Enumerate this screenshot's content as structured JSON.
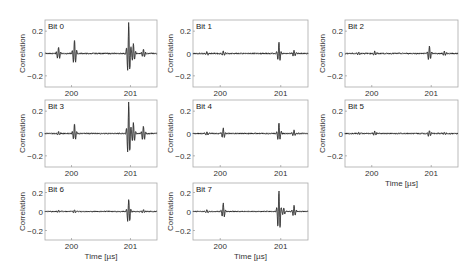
{
  "chart_data": [
    {
      "type": "line",
      "title": "Bit 0",
      "xlabel": "",
      "ylabel": "Correlation",
      "xlim": [
        199.55,
        201.45
      ],
      "ylim": [
        -0.3,
        0.3
      ],
      "xticks": [
        200,
        201
      ],
      "yticks": [
        -0.2,
        0,
        0.2
      ],
      "ytick_labels": [
        "−0.2",
        "0",
        "0.2"
      ],
      "series": [
        {
          "name": "signal",
          "bursts": [
            {
              "t": 199.78,
              "amp": 0.06
            },
            {
              "t": 200.05,
              "amp": 0.13,
              "neg": -0.12
            },
            {
              "t": 200.97,
              "amp": 0.28,
              "neg": -0.23
            },
            {
              "t": 201.05,
              "amp": 0.09
            },
            {
              "t": 201.22,
              "amp": 0.04
            }
          ]
        }
      ]
    },
    {
      "type": "line",
      "title": "Bit 1",
      "xlabel": "",
      "ylabel": "Correlation",
      "xlim": [
        199.55,
        201.45
      ],
      "ylim": [
        -0.3,
        0.3
      ],
      "xticks": [
        200,
        201
      ],
      "yticks": [
        -0.2,
        0,
        0.2
      ],
      "ytick_labels": [
        "−0.2",
        "0",
        "0.2"
      ],
      "series": [
        {
          "name": "signal",
          "bursts": [
            {
              "t": 199.78,
              "amp": 0.015
            },
            {
              "t": 200.05,
              "amp": 0.02
            },
            {
              "t": 200.97,
              "amp": 0.1,
              "neg": -0.09
            },
            {
              "t": 201.22,
              "amp": 0.03
            }
          ]
        }
      ]
    },
    {
      "type": "line",
      "title": "Bit 2",
      "xlabel": "",
      "ylabel": "Correlation",
      "xlim": [
        199.55,
        201.45
      ],
      "ylim": [
        -0.3,
        0.3
      ],
      "xticks": [
        200,
        201
      ],
      "yticks": [
        -0.2,
        0,
        0.2
      ],
      "ytick_labels": [
        "−0.2",
        "0",
        "0.2"
      ],
      "series": [
        {
          "name": "signal",
          "bursts": [
            {
              "t": 199.78,
              "amp": 0.015
            },
            {
              "t": 200.05,
              "amp": 0.02
            },
            {
              "t": 200.97,
              "amp": 0.07,
              "neg": -0.08
            },
            {
              "t": 201.22,
              "amp": 0.02
            }
          ]
        }
      ]
    },
    {
      "type": "line",
      "title": "Bit 3",
      "xlabel": "",
      "ylabel": "Correlation",
      "xlim": [
        199.55,
        201.45
      ],
      "ylim": [
        -0.3,
        0.3
      ],
      "xticks": [
        200,
        201
      ],
      "yticks": [
        -0.2,
        0,
        0.2
      ],
      "ytick_labels": [
        "−0.2",
        "0",
        "0.2"
      ],
      "series": [
        {
          "name": "signal",
          "bursts": [
            {
              "t": 199.78,
              "amp": 0.015
            },
            {
              "t": 200.05,
              "amp": 0.09,
              "neg": -0.08
            },
            {
              "t": 200.97,
              "amp": 0.28,
              "neg": -0.25
            },
            {
              "t": 201.05,
              "amp": 0.1
            },
            {
              "t": 201.22,
              "amp": 0.07,
              "neg": -0.08
            }
          ]
        }
      ]
    },
    {
      "type": "line",
      "title": "Bit 4",
      "xlabel": "",
      "ylabel": "Correlation",
      "xlim": [
        199.55,
        201.45
      ],
      "ylim": [
        -0.3,
        0.3
      ],
      "xticks": [
        200,
        201
      ],
      "yticks": [
        -0.2,
        0,
        0.2
      ],
      "ytick_labels": [
        "−0.2",
        "0",
        "0.2"
      ],
      "series": [
        {
          "name": "signal",
          "bursts": [
            {
              "t": 199.78,
              "amp": 0.015
            },
            {
              "t": 200.05,
              "amp": 0.05,
              "neg": -0.05
            },
            {
              "t": 200.97,
              "amp": 0.1,
              "neg": -0.08
            },
            {
              "t": 201.22,
              "amp": 0.03
            }
          ]
        }
      ]
    },
    {
      "type": "line",
      "title": "Bit 5",
      "xlabel": "Time [µs]",
      "ylabel": "Correlation",
      "xlim": [
        199.55,
        201.45
      ],
      "ylim": [
        -0.3,
        0.3
      ],
      "xticks": [
        200,
        201
      ],
      "yticks": [
        -0.2,
        0,
        0.2
      ],
      "ytick_labels": [
        "−0.2",
        "0",
        "0.2"
      ],
      "series": [
        {
          "name": "signal",
          "bursts": [
            {
              "t": 199.78,
              "amp": 0.01
            },
            {
              "t": 200.05,
              "amp": 0.02
            },
            {
              "t": 200.97,
              "amp": 0.03
            },
            {
              "t": 201.22,
              "amp": 0.01
            }
          ]
        }
      ]
    },
    {
      "type": "line",
      "title": "Bit 6",
      "xlabel": "Time [µs]",
      "ylabel": "Correlation",
      "xlim": [
        199.55,
        201.45
      ],
      "ylim": [
        -0.3,
        0.3
      ],
      "xticks": [
        200,
        201
      ],
      "yticks": [
        -0.2,
        0,
        0.2
      ],
      "ytick_labels": [
        "−0.2",
        "0",
        "0.2"
      ],
      "series": [
        {
          "name": "signal",
          "bursts": [
            {
              "t": 199.78,
              "amp": 0.01
            },
            {
              "t": 200.05,
              "amp": 0.02
            },
            {
              "t": 200.97,
              "amp": 0.13,
              "neg": -0.16
            },
            {
              "t": 201.22,
              "amp": 0.02
            }
          ]
        }
      ]
    },
    {
      "type": "line",
      "title": "Bit 7",
      "xlabel": "Time [µs]",
      "ylabel": "Correlation",
      "xlim": [
        199.55,
        201.45
      ],
      "ylim": [
        -0.3,
        0.3
      ],
      "xticks": [
        200,
        201
      ],
      "yticks": [
        -0.2,
        0,
        0.2
      ],
      "ytick_labels": [
        "−0.2",
        "0",
        "0.2"
      ],
      "series": [
        {
          "name": "signal",
          "bursts": [
            {
              "t": 199.78,
              "amp": 0.015
            },
            {
              "t": 200.05,
              "amp": 0.09,
              "neg": -0.08
            },
            {
              "t": 200.97,
              "amp": 0.22,
              "neg": -0.26
            },
            {
              "t": 201.05,
              "amp": 0.04
            },
            {
              "t": 201.22,
              "amp": 0.07,
              "neg": -0.06
            }
          ]
        }
      ]
    }
  ],
  "layout": {
    "panels": [
      {
        "x": 45,
        "y": 20,
        "w": 112,
        "h": 67
      },
      {
        "x": 193,
        "y": 20,
        "w": 115,
        "h": 67
      },
      {
        "x": 345,
        "y": 20,
        "w": 113,
        "h": 67
      },
      {
        "x": 45,
        "y": 100,
        "w": 112,
        "h": 67
      },
      {
        "x": 193,
        "y": 100,
        "w": 115,
        "h": 67
      },
      {
        "x": 345,
        "y": 100,
        "w": 113,
        "h": 67
      },
      {
        "x": 45,
        "y": 183,
        "w": 112,
        "h": 57
      },
      {
        "x": 193,
        "y": 183,
        "w": 115,
        "h": 57
      }
    ]
  },
  "colors": {
    "axis": "#aaaaaa",
    "signal": "#1a1a1a",
    "shadow": "#bbbbbb"
  }
}
